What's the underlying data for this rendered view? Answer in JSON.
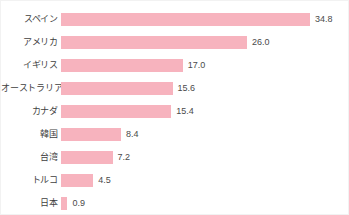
{
  "chart_data": {
    "type": "bar",
    "orientation": "horizontal",
    "title": "",
    "subtitle": "",
    "xlabel": "",
    "ylabel": "",
    "grid": false,
    "legend": false,
    "axis_visible": false,
    "xlim": [
      0,
      34.8
    ],
    "bar_color": "#f7b3be",
    "label_color": "#4a4a4a",
    "categories": [
      "スペイン",
      "アメリカ",
      "イギリス",
      "オーストラリア",
      "カナダ",
      "韓国",
      "台湾",
      "トルコ",
      "日本"
    ],
    "values": [
      34.8,
      26.0,
      17.0,
      15.6,
      15.4,
      8.4,
      7.2,
      4.5,
      0.9
    ],
    "value_labels": [
      "34.8",
      "26.0",
      "17.0",
      "15.6",
      "15.4",
      "8.4",
      "7.2",
      "4.5",
      "0.9"
    ]
  }
}
